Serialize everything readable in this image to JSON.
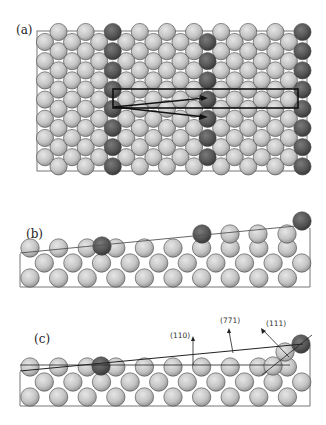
{
  "figure": {
    "panels": [
      {
        "id": "a",
        "label": "(a)",
        "view": "top view of stepped surface, three step-edge atom rows highlighted"
      },
      {
        "id": "b",
        "label": "(b)",
        "view": "side view, stepped surface with step-edge atoms"
      },
      {
        "id": "c",
        "label": "(c)",
        "view": "side view with facet normals"
      }
    ],
    "panel_c_annotations": [
      {
        "label": "(110)",
        "kind": "facet-normal"
      },
      {
        "label": "(771)",
        "kind": "surface-normal"
      },
      {
        "label": "(111)",
        "kind": "facet-normal"
      }
    ],
    "colors": {
      "terrace_atom": "#c4c4c4",
      "step_atom": "#555555",
      "outline": "#333333",
      "box": "#777777"
    }
  }
}
